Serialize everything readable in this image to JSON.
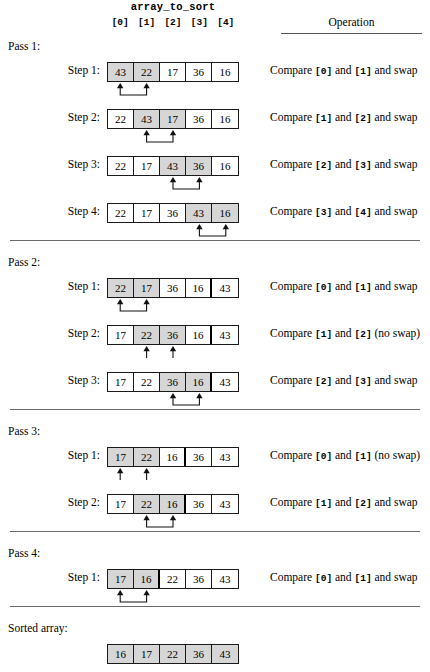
{
  "title": "array_to_sort",
  "column_headers": {
    "indices": [
      "[0]",
      "[1]",
      "[2]",
      "[3]",
      "[4]"
    ],
    "operation": "Operation"
  },
  "labels": {
    "pass1": "Pass 1:",
    "pass2": "Pass 2:",
    "pass3": "Pass 3:",
    "pass4": "Pass 4:",
    "sorted": "Sorted array:"
  },
  "passes": [
    {
      "name": "Pass 1:",
      "steps": [
        {
          "label": "Step 1:",
          "values": [
            "43",
            "22",
            "17",
            "36",
            "16"
          ],
          "highlight": [
            0,
            1
          ],
          "divider_after": null,
          "swap": true,
          "op_prefix": "Compare ",
          "op_index_a": "[0]",
          "op_mid": " and ",
          "op_index_b": "[1]",
          "op_suffix": " and swap"
        },
        {
          "label": "Step 2:",
          "values": [
            "22",
            "43",
            "17",
            "36",
            "16"
          ],
          "highlight": [
            1,
            2
          ],
          "divider_after": null,
          "swap": true,
          "op_prefix": "Compare ",
          "op_index_a": "[1]",
          "op_mid": " and ",
          "op_index_b": "[2]",
          "op_suffix": " and swap"
        },
        {
          "label": "Step 3:",
          "values": [
            "22",
            "17",
            "43",
            "36",
            "16"
          ],
          "highlight": [
            2,
            3
          ],
          "divider_after": null,
          "swap": true,
          "op_prefix": "Compare ",
          "op_index_a": "[2]",
          "op_mid": " and ",
          "op_index_b": "[3]",
          "op_suffix": " and swap"
        },
        {
          "label": "Step 4:",
          "values": [
            "22",
            "17",
            "36",
            "43",
            "16"
          ],
          "highlight": [
            3,
            4
          ],
          "divider_after": null,
          "swap": true,
          "op_prefix": "Compare ",
          "op_index_a": "[3]",
          "op_mid": " and ",
          "op_index_b": "[4]",
          "op_suffix": " and swap"
        }
      ]
    },
    {
      "name": "Pass 2:",
      "steps": [
        {
          "label": "Step 1:",
          "values": [
            "22",
            "17",
            "36",
            "16",
            "43"
          ],
          "highlight": [
            0,
            1
          ],
          "divider_after": 3,
          "swap": true,
          "op_prefix": "Compare ",
          "op_index_a": "[0]",
          "op_mid": " and ",
          "op_index_b": "[1]",
          "op_suffix": " and swap"
        },
        {
          "label": "Step 2:",
          "values": [
            "17",
            "22",
            "36",
            "16",
            "43"
          ],
          "highlight": [
            1,
            2
          ],
          "divider_after": 3,
          "swap": false,
          "op_prefix": "Compare ",
          "op_index_a": "[1]",
          "op_mid": " and ",
          "op_index_b": "[2]",
          "op_suffix": " (no swap)"
        },
        {
          "label": "Step 3:",
          "values": [
            "17",
            "22",
            "36",
            "16",
            "43"
          ],
          "highlight": [
            2,
            3
          ],
          "divider_after": 3,
          "swap": true,
          "op_prefix": "Compare ",
          "op_index_a": "[2]",
          "op_mid": " and ",
          "op_index_b": "[3]",
          "op_suffix": " and swap"
        }
      ]
    },
    {
      "name": "Pass 3:",
      "steps": [
        {
          "label": "Step 1:",
          "values": [
            "17",
            "22",
            "16",
            "36",
            "43"
          ],
          "highlight": [
            0,
            1
          ],
          "divider_after": 2,
          "swap": false,
          "op_prefix": "Compare ",
          "op_index_a": "[0]",
          "op_mid": " and ",
          "op_index_b": "[1]",
          "op_suffix": " (no swap)"
        },
        {
          "label": "Step 2:",
          "values": [
            "17",
            "22",
            "16",
            "36",
            "43"
          ],
          "highlight": [
            1,
            2
          ],
          "divider_after": 2,
          "swap": true,
          "op_prefix": "Compare ",
          "op_index_a": "[1]",
          "op_mid": " and ",
          "op_index_b": "[2]",
          "op_suffix": "  and swap"
        }
      ]
    },
    {
      "name": "Pass 4:",
      "steps": [
        {
          "label": "Step 1:",
          "values": [
            "17",
            "16",
            "22",
            "36",
            "43"
          ],
          "highlight": [
            0,
            1
          ],
          "divider_after": 1,
          "swap": true,
          "op_prefix": "Compare ",
          "op_index_a": "[0]",
          "op_mid": " and ",
          "op_index_b": "[1]",
          "op_suffix": " and swap"
        }
      ]
    }
  ],
  "sorted_array": {
    "label": "Sorted array:",
    "values": [
      "16",
      "17",
      "22",
      "36",
      "43"
    ],
    "all_shaded": true
  },
  "colors": {
    "shade": "#d6d6d6",
    "border": "#1a1a1a",
    "rule": "#6b6b6b",
    "background": "#ffffff"
  }
}
